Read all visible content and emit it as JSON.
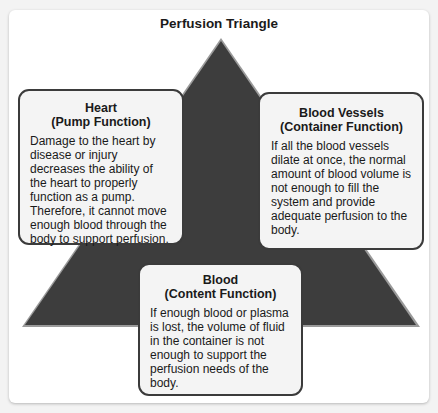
{
  "diagram": {
    "title": "Perfusion Triangle",
    "colors": {
      "triangle": "#3d3d3d",
      "box_bg": "#f4f4f4",
      "box_border": "#3b3b3b"
    },
    "boxes": [
      {
        "title": "Heart",
        "subtitle": "(Pump Function)",
        "text": "Damage to the heart by disease or injury decreases the ability of the heart to properly function as a pump. Therefore, it cannot move enough blood through the body to support perfusion."
      },
      {
        "title": "Blood Vessels",
        "subtitle": "(Container Function)",
        "text": "If all the blood vessels dilate at once, the normal amount of blood volume is not enough to fill the system and provide adequate perfusion to the body."
      },
      {
        "title": "Blood",
        "subtitle": "(Content Function)",
        "text": "If enough blood or plasma is lost, the volume of fluid in the container is not enough to support the perfusion needs of the body."
      }
    ]
  }
}
